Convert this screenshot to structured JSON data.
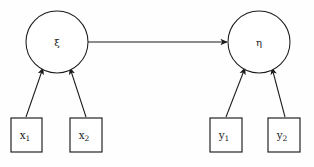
{
  "diagram": {
    "type": "path-diagram",
    "background_color": "#fefefe",
    "stroke_color": "#1a1a1a",
    "latent_variables": [
      {
        "id": "xi",
        "label": "ξ",
        "shape": "circle",
        "role": "exogenous-latent",
        "cx": 57,
        "cy": 42,
        "r": 31
      },
      {
        "id": "eta",
        "label": "η",
        "shape": "circle",
        "role": "endogenous-latent",
        "cx": 259,
        "cy": 42,
        "r": 31
      }
    ],
    "observed_variables": [
      {
        "id": "x1",
        "label": "x",
        "subscript": "1",
        "shape": "rectangle",
        "x": 11,
        "y": 118,
        "w": 31,
        "h": 34,
        "parent": "xi"
      },
      {
        "id": "x2",
        "label": "x",
        "subscript": "2",
        "shape": "rectangle",
        "x": 70,
        "y": 118,
        "w": 32,
        "h": 34,
        "parent": "xi"
      },
      {
        "id": "y1",
        "label": "y",
        "subscript": "1",
        "shape": "rectangle",
        "x": 210,
        "y": 118,
        "w": 32,
        "h": 34,
        "parent": "eta"
      },
      {
        "id": "y2",
        "label": "y",
        "subscript": "2",
        "shape": "rectangle",
        "x": 268,
        "y": 118,
        "w": 32,
        "h": 34,
        "parent": "eta"
      }
    ],
    "edges": [
      {
        "id": "xi-to-eta",
        "from": "xi",
        "to": "eta",
        "kind": "structural-path",
        "arrowhead": "to",
        "x1": 88,
        "y1": 42,
        "x2": 227,
        "y2": 42
      },
      {
        "id": "x1-to-xi",
        "from": "x1",
        "to": "xi",
        "kind": "measurement-path",
        "arrowhead": "to",
        "x1": 26,
        "y1": 117,
        "x2": 43,
        "y2": 68
      },
      {
        "id": "x2-to-xi",
        "from": "x2",
        "to": "xi",
        "kind": "measurement-path",
        "arrowhead": "to",
        "x1": 86,
        "y1": 117,
        "x2": 70,
        "y2": 68
      },
      {
        "id": "y1-to-eta",
        "from": "y1",
        "to": "eta",
        "kind": "measurement-path",
        "arrowhead": "to",
        "x1": 226,
        "y1": 117,
        "x2": 245,
        "y2": 68
      },
      {
        "id": "y2-to-eta",
        "from": "y2",
        "to": "eta",
        "kind": "measurement-path",
        "arrowhead": "to",
        "x1": 285,
        "y1": 117,
        "x2": 272,
        "y2": 68
      }
    ]
  }
}
